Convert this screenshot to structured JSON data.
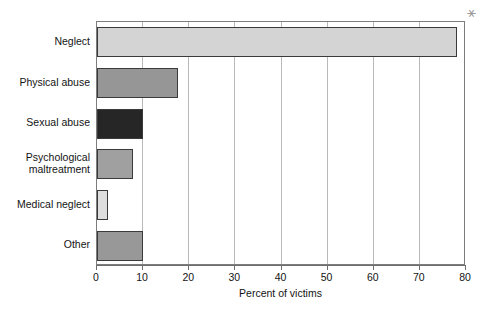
{
  "chart_data": {
    "type": "bar",
    "orientation": "horizontal",
    "title": "",
    "xlabel": "Percent of victims",
    "ylabel": "",
    "xlim": [
      0,
      80
    ],
    "xticks": [
      0,
      10,
      20,
      30,
      40,
      50,
      60,
      70,
      80
    ],
    "grid": "vertical",
    "legend": "none",
    "categories": [
      "Neglect",
      "Physical abuse",
      "Sexual abuse",
      "Psychological\nmaltreatment",
      "Medical neglect",
      "Other"
    ],
    "values": [
      78,
      17.6,
      10,
      7.8,
      2.3,
      10
    ],
    "bar_colors": [
      "#d4d4d4",
      "#969696",
      "#262626",
      "#a0a0a0",
      "#dedede",
      "#989898"
    ],
    "bar_edge_color": "#3a3a3a",
    "axis_color": "#6e6e6e",
    "grid_color": "#b9b9b9"
  },
  "marks": {
    "scan_mark": "⚹"
  }
}
